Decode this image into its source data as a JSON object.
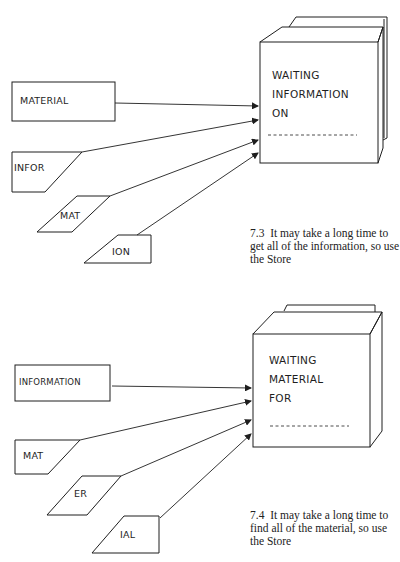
{
  "figures": [
    {
      "store": {
        "lines": [
          "WAITING",
          "INFORMATION",
          "ON"
        ],
        "placeholder": "- - - - - - - - - - -"
      },
      "source_box": "MATERIAL",
      "fragments": [
        "INFOR",
        "MAT",
        "ION"
      ],
      "caption": {
        "number": "7.3",
        "text": "It may take a long time to get all of the information, so use the Store"
      }
    },
    {
      "store": {
        "lines": [
          "WAITING",
          "MATERIAL",
          "FOR"
        ],
        "placeholder": "- - - - - - - - - - -"
      },
      "source_box": "INFORMATION",
      "fragments": [
        "MAT",
        "ER",
        "IAL"
      ],
      "caption": {
        "number": "7.4",
        "text": "It may take a long time to find all of the material, so use the Store"
      }
    }
  ],
  "colors": {
    "ink": "#1e1e1e",
    "paper": "#ffffff"
  }
}
